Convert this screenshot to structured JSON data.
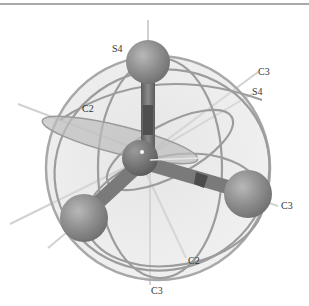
{
  "figure": {
    "colors": {
      "background": "#ffffff",
      "border": "#a9a9a9",
      "atom": "#8a8a8a",
      "atom_highlight": "#b5b5b5",
      "bond": "#6e6e6e",
      "plane_fill": "#d6d6d6",
      "ring": "#9a9a9a",
      "axis": "#d0d0d0",
      "label": "#333333"
    }
  },
  "labels": [
    {
      "text": "S4",
      "x": 112,
      "y": 44
    },
    {
      "text": "C3",
      "x": 258,
      "y": 67
    },
    {
      "text": "S4",
      "x": 252,
      "y": 87
    },
    {
      "text": "C2",
      "x": 82,
      "y": 104
    },
    {
      "text": "C3",
      "x": 281,
      "y": 201
    },
    {
      "text": "C2",
      "x": 188,
      "y": 256
    },
    {
      "text": "C3",
      "x": 151,
      "y": 286
    }
  ]
}
